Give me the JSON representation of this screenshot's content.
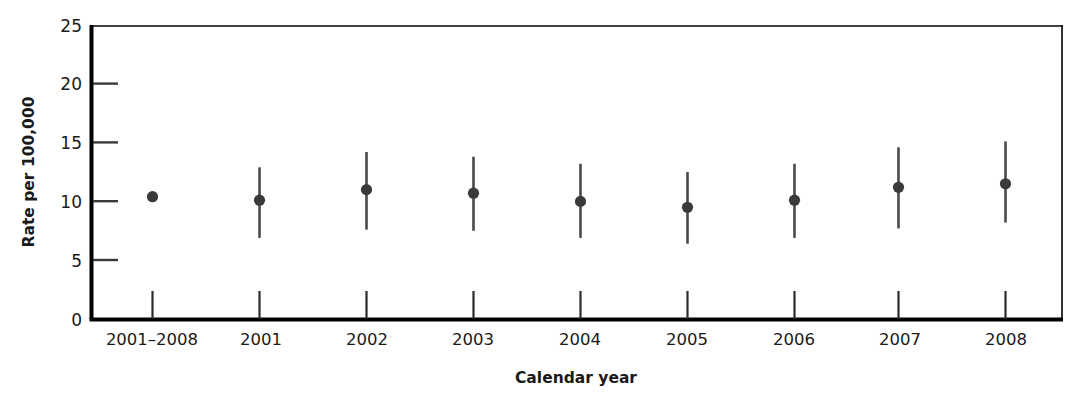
{
  "chart_data": {
    "type": "scatter",
    "title": "",
    "subtitle": "",
    "xlabel": "Calendar year",
    "ylabel": "Rate per 100,000",
    "categories": [
      "2001–2008",
      "2001",
      "2002",
      "2003",
      "2004",
      "2005",
      "2006",
      "2007",
      "2008"
    ],
    "values": [
      10.4,
      10.1,
      11.0,
      10.7,
      10.0,
      9.5,
      10.1,
      11.2,
      11.5
    ],
    "error_low": [
      10.0,
      6.9,
      7.6,
      7.5,
      6.9,
      6.4,
      6.9,
      7.7,
      8.2
    ],
    "error_high": [
      10.8,
      12.9,
      14.2,
      13.8,
      13.2,
      12.5,
      13.2,
      14.6,
      15.1
    ],
    "ylim": [
      0,
      25
    ],
    "yticks": [
      0,
      5,
      10,
      15,
      20,
      25
    ],
    "ytick_labels": [
      "0",
      "5",
      "10",
      "15",
      "20",
      "25"
    ],
    "grid": false,
    "legend_position": "none",
    "marker": "filled-circle",
    "marker_color": "#3a3a3a",
    "errorbar_color": "#4a4a4a",
    "axis_color": "#000000",
    "series": [
      {
        "name": "Rate per 100,000",
        "points": [
          {
            "category": "2001–2008",
            "value": 10.4,
            "low": 10.0,
            "high": 10.8
          },
          {
            "category": "2001",
            "value": 10.1,
            "low": 6.9,
            "high": 12.9
          },
          {
            "category": "2002",
            "value": 11.0,
            "low": 7.6,
            "high": 14.2
          },
          {
            "category": "2003",
            "value": 10.7,
            "low": 7.5,
            "high": 13.8
          },
          {
            "category": "2004",
            "value": 10.0,
            "low": 6.9,
            "high": 13.2
          },
          {
            "category": "2005",
            "value": 9.5,
            "low": 6.4,
            "high": 12.5
          },
          {
            "category": "2006",
            "value": 10.1,
            "low": 6.9,
            "high": 13.2
          },
          {
            "category": "2007",
            "value": 11.2,
            "low": 7.7,
            "high": 14.6
          },
          {
            "category": "2008",
            "value": 11.5,
            "low": 8.2,
            "high": 15.1
          }
        ]
      }
    ]
  },
  "axes": {
    "y_title": "Rate per 100,000",
    "x_title": "Calendar year"
  },
  "y_tick_labels": {
    "t0": "0",
    "t5": "5",
    "t10": "10",
    "t15": "15",
    "t20": "20",
    "t25": "25"
  },
  "x_tick_labels": {
    "c0": "2001–2008",
    "c1": "2001",
    "c2": "2002",
    "c3": "2003",
    "c4": "2004",
    "c5": "2005",
    "c6": "2006",
    "c7": "2007",
    "c8": "2008"
  }
}
